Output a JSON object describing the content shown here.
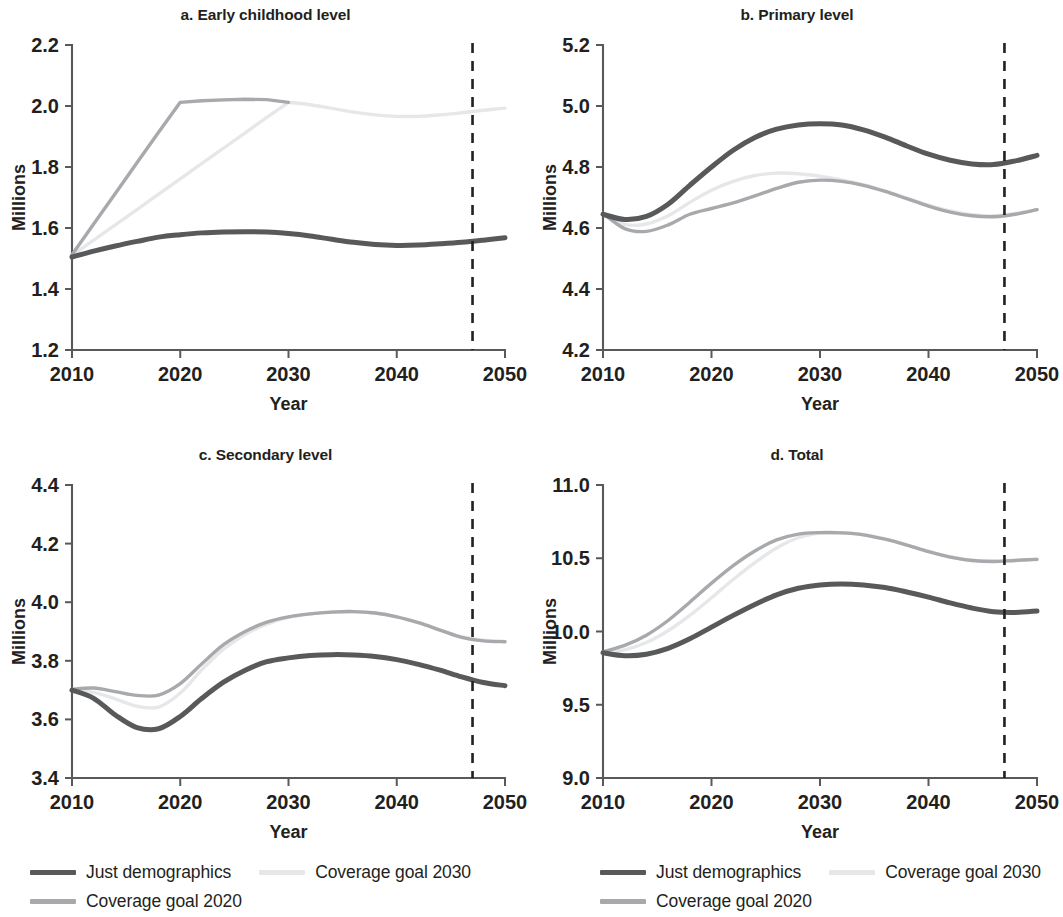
{
  "figure": {
    "series_names": [
      "Just demographics",
      "Coverage goal 2020",
      "Coverage goal 2030"
    ],
    "series_colors": [
      "#58595b",
      "#a7a9ac",
      "#e6e7e8"
    ],
    "vline_color": "#231f20"
  },
  "legend": {
    "left": {
      "row1_item1_label": "Just demographics",
      "row1_item2_label": "Coverage goal 2030",
      "row2_item1_label": "Coverage goal 2020"
    },
    "right": {
      "row1_item1_label": "Just demographics",
      "row1_item2_label": "Coverage goal 2030",
      "row2_item1_label": "Coverage goal 2020"
    }
  },
  "chart_data": [
    {
      "id": "a",
      "type": "line",
      "title": "a. Early childhood level",
      "xlabel": "Year",
      "ylabel": "Millions",
      "xlim": [
        2010,
        2050
      ],
      "ylim": [
        1.2,
        2.2
      ],
      "xticks": [
        2010,
        2020,
        2030,
        2040,
        2050
      ],
      "xticklabels": [
        "2010",
        "2020",
        "2030",
        "2040",
        "2050"
      ],
      "yticks": [
        1.2,
        1.4,
        1.6,
        1.8,
        2.0,
        2.2
      ],
      "yticklabels": [
        "1.2",
        "1.4",
        "1.6",
        "1.8",
        "2.0",
        "2.2"
      ],
      "grid": false,
      "legend_position": "below-figure",
      "annotations": [
        {
          "type": "vline",
          "x": 2047,
          "style": "dashed"
        }
      ],
      "x": [
        2010,
        2012,
        2014,
        2016,
        2018,
        2020,
        2022,
        2024,
        2026,
        2028,
        2030,
        2032,
        2034,
        2036,
        2038,
        2040,
        2042,
        2044,
        2046,
        2048,
        2050
      ],
      "series": [
        {
          "name": "Just demographics",
          "color": "#58595b",
          "values": [
            1.505,
            1.524,
            1.541,
            1.556,
            1.57,
            1.578,
            1.584,
            1.587,
            1.588,
            1.587,
            1.582,
            1.574,
            1.563,
            1.553,
            1.546,
            1.543,
            1.544,
            1.548,
            1.553,
            1.56,
            1.568
          ]
        },
        {
          "name": "Coverage goal 2020",
          "color": "#a7a9ac",
          "values": [
            1.512,
            1.613,
            1.713,
            1.814,
            1.914,
            2.012,
            2.017,
            2.02,
            2.022,
            2.021,
            2.012,
            null,
            null,
            null,
            null,
            null,
            null,
            null,
            null,
            null,
            null
          ]
        },
        {
          "name": "Coverage goal 2030",
          "color": "#e6e7e8",
          "values": [
            1.51,
            1.56,
            1.61,
            1.66,
            1.711,
            1.761,
            1.812,
            1.862,
            1.912,
            1.963,
            2.012,
            2.004,
            1.992,
            1.98,
            1.971,
            1.966,
            1.966,
            1.971,
            1.978,
            1.986,
            1.993
          ]
        }
      ]
    },
    {
      "id": "b",
      "type": "line",
      "title": "b. Primary level",
      "xlabel": "Year",
      "ylabel": "Millions",
      "xlim": [
        2010,
        2050
      ],
      "ylim": [
        4.2,
        5.2
      ],
      "xticks": [
        2010,
        2020,
        2030,
        2040,
        2050
      ],
      "xticklabels": [
        "2010",
        "2020",
        "2030",
        "2040",
        "2050"
      ],
      "yticks": [
        4.2,
        4.4,
        4.6,
        4.8,
        5.0,
        5.2
      ],
      "yticklabels": [
        "4.2",
        "4.4",
        "4.6",
        "4.8",
        "5.0",
        "5.2"
      ],
      "grid": false,
      "legend_position": "below-figure",
      "annotations": [
        {
          "type": "vline",
          "x": 2047,
          "style": "dashed"
        }
      ],
      "x": [
        2010,
        2012,
        2014,
        2016,
        2018,
        2020,
        2022,
        2024,
        2026,
        2028,
        2030,
        2032,
        2034,
        2036,
        2038,
        2040,
        2042,
        2044,
        2046,
        2048,
        2050
      ],
      "series": [
        {
          "name": "Just demographics",
          "color": "#58595b",
          "values": [
            4.645,
            4.628,
            4.638,
            4.678,
            4.74,
            4.8,
            4.855,
            4.897,
            4.924,
            4.938,
            4.942,
            4.938,
            4.922,
            4.898,
            4.869,
            4.842,
            4.822,
            4.81,
            4.808,
            4.82,
            4.838
          ]
        },
        {
          "name": "Coverage goal 2020",
          "color": "#a7a9ac",
          "values": [
            4.648,
            4.598,
            4.589,
            4.61,
            4.645,
            4.664,
            4.682,
            4.705,
            4.73,
            4.75,
            4.757,
            4.753,
            4.74,
            4.72,
            4.696,
            4.672,
            4.652,
            4.64,
            4.637,
            4.645,
            4.66
          ]
        },
        {
          "name": "Coverage goal 2030",
          "color": "#e6e7e8",
          "values": [
            4.645,
            4.612,
            4.613,
            4.64,
            4.684,
            4.724,
            4.753,
            4.772,
            4.78,
            4.778,
            4.77,
            4.758,
            4.742,
            4.722,
            4.698,
            4.675,
            4.656,
            4.644,
            4.64,
            4.648,
            4.66
          ]
        }
      ]
    },
    {
      "id": "c",
      "type": "line",
      "title": "c. Secondary level",
      "xlabel": "Year",
      "ylabel": "Millions",
      "xlim": [
        2010,
        2050
      ],
      "ylim": [
        3.4,
        4.4
      ],
      "xticks": [
        2010,
        2020,
        2030,
        2040,
        2050
      ],
      "xticklabels": [
        "2010",
        "2020",
        "2030",
        "2040",
        "2050"
      ],
      "yticks": [
        3.4,
        3.6,
        3.8,
        4.0,
        4.2,
        4.4
      ],
      "yticklabels": [
        "3.4",
        "3.6",
        "3.8",
        "4.0",
        "4.2",
        "4.4"
      ],
      "grid": false,
      "legend_position": "below-figure",
      "annotations": [
        {
          "type": "vline",
          "x": 2047,
          "style": "dashed"
        }
      ],
      "x": [
        2010,
        2012,
        2014,
        2016,
        2018,
        2020,
        2022,
        2024,
        2026,
        2028,
        2030,
        2032,
        2034,
        2036,
        2038,
        2040,
        2042,
        2044,
        2046,
        2048,
        2050
      ],
      "series": [
        {
          "name": "Just demographics",
          "color": "#58595b",
          "values": [
            3.7,
            3.672,
            3.615,
            3.572,
            3.568,
            3.61,
            3.672,
            3.727,
            3.768,
            3.797,
            3.81,
            3.818,
            3.821,
            3.82,
            3.815,
            3.804,
            3.788,
            3.768,
            3.745,
            3.726,
            3.715
          ]
        },
        {
          "name": "Coverage goal 2020",
          "color": "#a7a9ac",
          "values": [
            3.703,
            3.707,
            3.695,
            3.682,
            3.683,
            3.722,
            3.79,
            3.855,
            3.9,
            3.932,
            3.95,
            3.96,
            3.966,
            3.968,
            3.963,
            3.95,
            3.93,
            3.905,
            3.88,
            3.868,
            3.865
          ]
        },
        {
          "name": "Coverage goal 2030",
          "color": "#e6e7e8",
          "values": [
            3.7,
            3.692,
            3.67,
            3.645,
            3.642,
            3.69,
            3.77,
            3.84,
            3.89,
            3.925,
            3.948,
            3.96,
            3.967,
            3.968,
            3.963,
            3.95,
            3.93,
            3.905,
            3.882,
            3.87,
            3.866
          ]
        }
      ]
    },
    {
      "id": "d",
      "type": "line",
      "title": "d. Total",
      "xlabel": "Year",
      "ylabel": "Millions",
      "xlim": [
        2010,
        2050
      ],
      "ylim": [
        9.0,
        11.0
      ],
      "xticks": [
        2010,
        2020,
        2030,
        2040,
        2050
      ],
      "xticklabels": [
        "2010",
        "2020",
        "2030",
        "2040",
        "2050"
      ],
      "yticks": [
        9.0,
        9.5,
        10.0,
        10.5,
        11.0
      ],
      "yticklabels": [
        "9.0",
        "9.5",
        "10.0",
        "10.5",
        "11.0"
      ],
      "grid": false,
      "legend_position": "below-figure",
      "annotations": [
        {
          "type": "vline",
          "x": 2047,
          "style": "dashed"
        }
      ],
      "x": [
        2010,
        2012,
        2014,
        2016,
        2018,
        2020,
        2022,
        2024,
        2026,
        2028,
        2030,
        2032,
        2034,
        2036,
        2038,
        2040,
        2042,
        2044,
        2046,
        2048,
        2050
      ],
      "series": [
        {
          "name": "Just demographics",
          "color": "#58595b",
          "values": [
            9.855,
            9.835,
            9.845,
            9.885,
            9.95,
            10.03,
            10.11,
            10.185,
            10.25,
            10.295,
            10.318,
            10.325,
            10.318,
            10.3,
            10.27,
            10.235,
            10.195,
            10.16,
            10.135,
            10.13,
            10.14
          ]
        },
        {
          "name": "Coverage goal 2020",
          "color": "#a7a9ac",
          "values": [
            9.862,
            9.905,
            9.975,
            10.075,
            10.2,
            10.33,
            10.45,
            10.55,
            10.625,
            10.665,
            10.675,
            10.673,
            10.66,
            10.63,
            10.59,
            10.545,
            10.508,
            10.485,
            10.478,
            10.485,
            10.492
          ]
        },
        {
          "name": "Coverage goal 2030",
          "color": "#e6e7e8",
          "values": [
            9.858,
            9.875,
            9.925,
            10.005,
            10.11,
            10.23,
            10.355,
            10.47,
            10.57,
            10.64,
            10.672,
            10.675,
            10.662,
            10.632,
            10.592,
            10.548,
            10.51,
            10.487,
            10.48,
            10.487,
            10.494
          ]
        }
      ]
    }
  ]
}
